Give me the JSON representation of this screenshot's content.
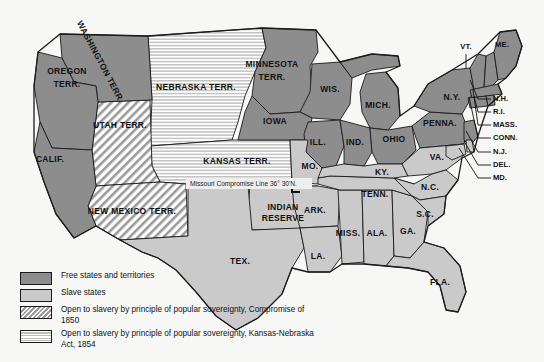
{
  "map": {
    "title": "United States in 1854: Slavery Status by State and Territory",
    "background_color": "#f7f7f5",
    "colors": {
      "free": "#8d8d8d",
      "slave": "#cacaca",
      "hatch_stroke": "#9a9a9a",
      "stripe_stroke": "#bdbdbd",
      "border": "#1a1a1a",
      "water": "#ffffff",
      "text": "#111111"
    },
    "annotation": {
      "missouri_compromise_line": "Missouri Compromise Line 36° 30'N."
    }
  },
  "legend": {
    "items": [
      {
        "swatch": "free",
        "label": "Free states and territories"
      },
      {
        "swatch": "slave",
        "label": "Slave states"
      },
      {
        "swatch": "hatch",
        "label": "Open to slavery by principle of popular sovereignty, Compromise of 1850"
      },
      {
        "swatch": "stripe",
        "label": "Open to slavery by principle of popular sovereignty, Kansas-Nebraska Act, 1854"
      }
    ]
  },
  "regions": {
    "free": [
      {
        "id": "washington-terr",
        "label": "WASHINGTON TERR.",
        "x": 100,
        "y": 62,
        "size": "sz-md",
        "rotate": 62
      },
      {
        "id": "oregon-terr",
        "label": "OREGON",
        "x": 67,
        "y": 72,
        "size": "sz-md",
        "rotate": 0
      },
      {
        "id": "oregon-terr-2",
        "label": "TERR.",
        "x": 67,
        "y": 85,
        "size": "sz-md",
        "rotate": 0
      },
      {
        "id": "california",
        "label": "CALIF.",
        "x": 50,
        "y": 160,
        "size": "sz-md",
        "rotate": 0
      },
      {
        "id": "minnesota-terr",
        "label": "MINNESOTA",
        "x": 272,
        "y": 65,
        "size": "sz-md",
        "rotate": 0
      },
      {
        "id": "minnesota-terr-2",
        "label": "TERR.",
        "x": 272,
        "y": 78,
        "size": "sz-md",
        "rotate": 0
      },
      {
        "id": "wisconsin",
        "label": "WIS.",
        "x": 330,
        "y": 90,
        "size": "sz-md",
        "rotate": 0
      },
      {
        "id": "iowa",
        "label": "IOWA",
        "x": 275,
        "y": 122,
        "size": "sz-md",
        "rotate": 0
      },
      {
        "id": "michigan",
        "label": "MICH.",
        "x": 378,
        "y": 106,
        "size": "sz-md",
        "rotate": 0
      },
      {
        "id": "illinois",
        "label": "ILL.",
        "x": 318,
        "y": 143,
        "size": "sz-md",
        "rotate": 0
      },
      {
        "id": "indiana",
        "label": "IND.",
        "x": 355,
        "y": 143,
        "size": "sz-md",
        "rotate": 0
      },
      {
        "id": "ohio",
        "label": "OHIO",
        "x": 394,
        "y": 140,
        "size": "sz-md",
        "rotate": 0
      },
      {
        "id": "pennsylvania",
        "label": "PENNA.",
        "x": 440,
        "y": 124,
        "size": "sz-md",
        "rotate": 0
      },
      {
        "id": "new-york",
        "label": "N.Y.",
        "x": 452,
        "y": 98,
        "size": "sz-md",
        "rotate": 0
      },
      {
        "id": "vermont",
        "label": "VT.",
        "x": 466,
        "y": 47,
        "size": "sz-sm",
        "rotate": 0
      },
      {
        "id": "maine",
        "label": "ME.",
        "x": 502,
        "y": 45,
        "size": "sz-sm",
        "rotate": 0
      }
    ],
    "slave": [
      {
        "id": "texas",
        "label": "TEX.",
        "x": 240,
        "y": 262,
        "size": "sz-md",
        "rotate": 0
      },
      {
        "id": "missouri",
        "label": "MO.",
        "x": 310,
        "y": 167,
        "size": "sz-md",
        "rotate": 0
      },
      {
        "id": "arkansas",
        "label": "ARK.",
        "x": 315,
        "y": 211,
        "size": "sz-md",
        "rotate": 0
      },
      {
        "id": "louisiana",
        "label": "LA.",
        "x": 318,
        "y": 257,
        "size": "sz-md",
        "rotate": 0
      },
      {
        "id": "mississippi",
        "label": "MISS.",
        "x": 348,
        "y": 234,
        "size": "sz-md",
        "rotate": 0
      },
      {
        "id": "alabama",
        "label": "ALA.",
        "x": 377,
        "y": 234,
        "size": "sz-md",
        "rotate": 0
      },
      {
        "id": "georgia",
        "label": "GA.",
        "x": 408,
        "y": 232,
        "size": "sz-md",
        "rotate": 0
      },
      {
        "id": "florida",
        "label": "FLA.",
        "x": 440,
        "y": 283,
        "size": "sz-md",
        "rotate": 0
      },
      {
        "id": "tennessee",
        "label": "TENN.",
        "x": 375,
        "y": 195,
        "size": "sz-md",
        "rotate": 0
      },
      {
        "id": "kentucky",
        "label": "KY.",
        "x": 382,
        "y": 173,
        "size": "sz-md",
        "rotate": 0
      },
      {
        "id": "virginia",
        "label": "VA.",
        "x": 437,
        "y": 158,
        "size": "sz-md",
        "rotate": 0
      },
      {
        "id": "north-carolina",
        "label": "N.C.",
        "x": 430,
        "y": 188,
        "size": "sz-md",
        "rotate": 0
      },
      {
        "id": "south-carolina",
        "label": "S.C.",
        "x": 425,
        "y": 215,
        "size": "sz-md",
        "rotate": 0
      },
      {
        "id": "indian-reserve",
        "label": "INDIAN",
        "x": 283,
        "y": 208,
        "size": "sz-md",
        "rotate": 0
      },
      {
        "id": "indian-reserve-2",
        "label": "RESERVE",
        "x": 283,
        "y": 219,
        "size": "sz-md",
        "rotate": 0
      }
    ],
    "hatch": [
      {
        "id": "utah-terr",
        "label": "UTAH TERR.",
        "x": 120,
        "y": 126,
        "size": "sz-md",
        "rotate": 0
      },
      {
        "id": "new-mexico-terr",
        "label": "NEW MEXICO TERR.",
        "x": 132,
        "y": 212,
        "size": "sz-md",
        "rotate": 0
      }
    ],
    "stripe": [
      {
        "id": "nebraska-terr",
        "label": "NEBRASKA TERR.",
        "x": 196,
        "y": 88,
        "size": "sz-md",
        "rotate": 0
      },
      {
        "id": "kansas-terr",
        "label": "KANSAS TERR.",
        "x": 237,
        "y": 162,
        "size": "sz-md",
        "rotate": 0
      }
    ]
  },
  "leader_labels": [
    {
      "id": "new-hampshire",
      "label": "N.H.",
      "tx": 493,
      "ty": 99,
      "path": "M 491 99 L 478 99 L 470 80"
    },
    {
      "id": "rhode-island",
      "label": "R.I.",
      "tx": 493,
      "ty": 112,
      "path": "M 491 112 L 478 112 L 474 96"
    },
    {
      "id": "massachusetts",
      "label": "MASS.",
      "tx": 493,
      "ty": 125,
      "path": "M 491 125 L 478 125 L 473 90"
    },
    {
      "id": "connecticut",
      "label": "CONN.",
      "tx": 493,
      "ty": 138,
      "path": "M 491 138 L 478 138 L 469 97"
    },
    {
      "id": "new-jersey",
      "label": "N.J.",
      "tx": 493,
      "ty": 152,
      "path": "M 491 152 L 478 152 L 466 131"
    },
    {
      "id": "delaware",
      "label": "DEL.",
      "tx": 493,
      "ty": 165,
      "path": "M 491 165 L 478 165 L 464 141"
    },
    {
      "id": "maryland",
      "label": "MD.",
      "tx": 493,
      "ty": 178,
      "path": "M 491 178 L 478 178 L 459 148"
    },
    {
      "id": "vermont-leader",
      "label": "",
      "tx": 0,
      "ty": 0,
      "path": "M 466 54 L 466 68"
    }
  ]
}
